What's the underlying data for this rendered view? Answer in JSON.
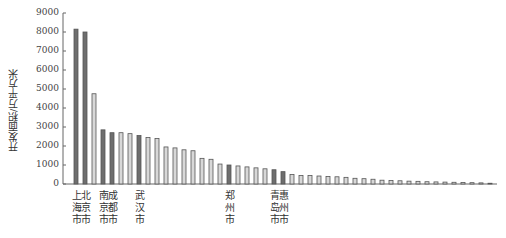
{
  "chart_data": {
    "type": "bar",
    "title": "",
    "xlabel": "",
    "ylabel": "开发面积/万平方米",
    "ylim": [
      0,
      9000
    ],
    "yticks": [
      0,
      1000,
      2000,
      3000,
      4000,
      5000,
      6000,
      7000,
      8000,
      9000
    ],
    "grid": false,
    "legend": null,
    "categories": [
      "上海市",
      "北京市",
      "",
      "南京市",
      "成都市",
      "",
      "",
      "武汉市",
      "",
      "",
      "",
      "",
      "",
      "",
      "",
      "",
      "",
      "郑州市",
      "",
      "",
      "",
      "",
      "青岛市",
      "惠州市",
      "",
      "",
      "",
      "",
      "",
      "",
      "",
      "",
      "",
      "",
      "",
      "",
      "",
      "",
      "",
      "",
      "",
      "",
      "",
      "",
      "",
      "",
      ""
    ],
    "values": [
      8150,
      8000,
      4750,
      2850,
      2700,
      2700,
      2650,
      2550,
      2450,
      2400,
      1950,
      1900,
      1800,
      1750,
      1350,
      1300,
      1050,
      1000,
      950,
      900,
      850,
      800,
      750,
      650,
      500,
      450,
      450,
      420,
      400,
      380,
      350,
      300,
      280,
      250,
      200,
      180,
      170,
      150,
      140,
      120,
      110,
      100,
      90,
      80,
      70,
      60,
      40
    ],
    "highlighted": [
      0,
      1,
      3,
      4,
      7,
      17,
      22,
      23
    ],
    "colors": {
      "highlight": "#6e6e6e",
      "normal": "#d8d8d8",
      "outline": "#555555"
    }
  }
}
